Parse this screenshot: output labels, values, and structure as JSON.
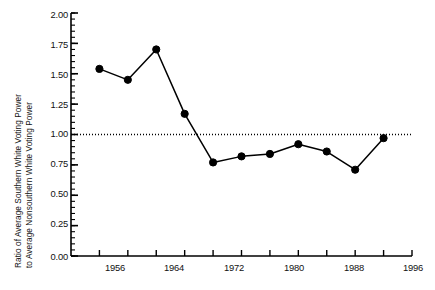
{
  "chart_data": {
    "type": "line",
    "title": "",
    "xlabel": "",
    "ylabel": "Ratio of Average Southern White Voting Power to Average Nonsouthern White Voting Power",
    "ylabel_lines": [
      "Ratio of Average Southern White Voting Power",
      "to Average Nonsouthern White Voting Power"
    ],
    "x": [
      1952,
      1956,
      1960,
      1964,
      1968,
      1972,
      1976,
      1980,
      1984,
      1988,
      1992
    ],
    "values": [
      1.54,
      1.45,
      1.7,
      1.17,
      0.77,
      0.82,
      0.84,
      0.92,
      0.86,
      0.71,
      0.97
    ],
    "xlim": [
      1948,
      1996
    ],
    "ylim": [
      0.0,
      2.0
    ],
    "ytick_labels": [
      "0.00",
      "0.25",
      "0.50",
      "0.75",
      "1.00",
      "1.25",
      "1.50",
      "1.75",
      "2.00"
    ],
    "ytick_values": [
      0.0,
      0.25,
      0.5,
      0.75,
      1.0,
      1.25,
      1.5,
      1.75,
      2.0
    ],
    "yminor_step": 0.05,
    "xtick_values": [
      1952,
      1956,
      1960,
      1964,
      1968,
      1972,
      1976,
      1980,
      1984,
      1988,
      1992,
      1996
    ],
    "xtick_labels": [
      "1956",
      "1964",
      "1972",
      "1980",
      "1988",
      "1996"
    ],
    "xtick_label_values": [
      1956,
      1964,
      1972,
      1980,
      1988,
      1996
    ],
    "reference_line": {
      "value": 1.0,
      "style": "dotted",
      "color": "#000000"
    },
    "grid": false,
    "legend": null,
    "series_color": "#000000",
    "marker": "filled-circle"
  }
}
